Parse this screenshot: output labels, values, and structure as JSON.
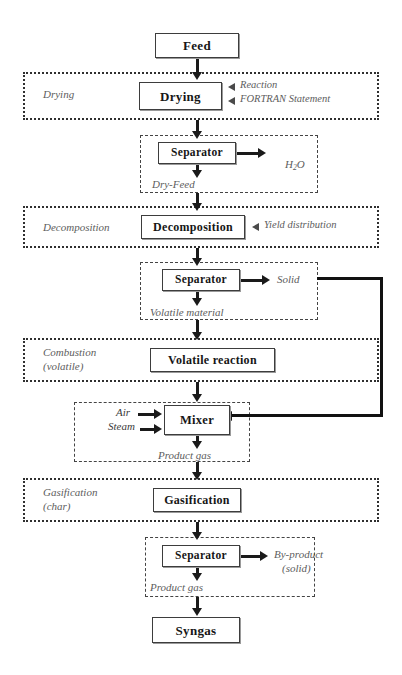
{
  "diagram": {
    "background": "#ffffff",
    "line_color": "#1a1a1a",
    "label_color": "#5d5d5d"
  },
  "boxes": {
    "feed": "Feed",
    "drying": "Drying",
    "separator1": "Separator",
    "decomposition": "Decomposition",
    "separator2": "Separator",
    "volatile_reaction": "Volatile reaction",
    "mixer": "Mixer",
    "gasification": "Gasification",
    "separator3": "Separator",
    "syngas": "Syngas"
  },
  "sections": {
    "drying": "Drying",
    "decomposition": "Decomposition",
    "combustion_line1": "Combustion",
    "combustion_line2": "(volatile)",
    "gasification_line1": "Gasification",
    "gasification_line2": "(char)"
  },
  "legend": {
    "reaction": "Reaction",
    "fortran": "FORTRAN Statement",
    "yield": "Yield distribution"
  },
  "streams": {
    "water_pre": "H",
    "water_sub": "2",
    "water_post": "O",
    "dry_feed": "Dry-Feed",
    "solid": "Solid",
    "volatile_material": "Volatile material",
    "air": "Air",
    "steam": "Steam",
    "product_gas_mixer": "Product gas",
    "byproduct_line1": "By-product",
    "byproduct_line2": "(solid)",
    "product_gas_final": "Product gas"
  }
}
